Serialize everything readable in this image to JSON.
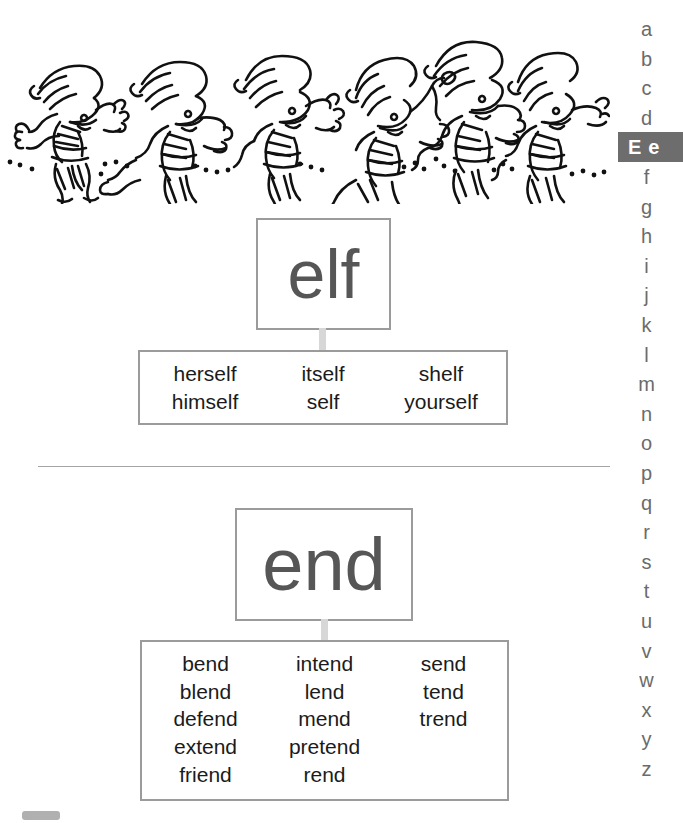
{
  "illustration": {
    "name": "jumping-elves-drawing",
    "description": "Six hand-drawn elves with pointed hats leaping along a dotted ground line",
    "elf_count": 6,
    "ink_color": "#111111"
  },
  "divider": {
    "color": "#a5a5a5"
  },
  "entries": [
    {
      "id": "elf",
      "headword": "elf",
      "columns": [
        {
          "words": [
            "herself",
            "himself"
          ]
        },
        {
          "words": [
            "itself",
            "self"
          ]
        },
        {
          "words": [
            "shelf",
            "yourself"
          ]
        }
      ]
    },
    {
      "id": "end",
      "headword": "end",
      "columns": [
        {
          "words": [
            "bend",
            "blend",
            "defend",
            "extend",
            "friend"
          ]
        },
        {
          "words": [
            "intend",
            "lend",
            "mend",
            "pretend",
            "rend"
          ]
        },
        {
          "words": [
            "send",
            "tend",
            "trend"
          ]
        }
      ]
    }
  ],
  "sidebar": {
    "active_letter": "e",
    "active_label_upper": "E",
    "active_label_lower": "e",
    "letters": [
      "a",
      "b",
      "c",
      "d",
      "e",
      "f",
      "g",
      "h",
      "i",
      "j",
      "k",
      "l",
      "m",
      "n",
      "o",
      "p",
      "q",
      "r",
      "s",
      "t",
      "u",
      "v",
      "w",
      "x",
      "y",
      "z"
    ],
    "highlight_color": "#6d6d6d",
    "letter_color": "#6b6b6b"
  },
  "colors": {
    "box_border": "#9b9b9b",
    "headword_text": "#565656",
    "word_text": "#1b1b1b",
    "connector": "#d7d7d7"
  }
}
